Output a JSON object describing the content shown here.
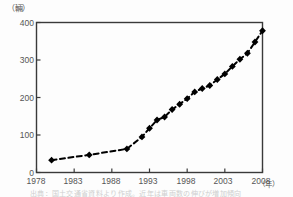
{
  "figure": {
    "unit_y": "（輛）",
    "unit_x": "（年）",
    "caption": "出典：国土交通省資料より作成。近年は車両数の伸びが増加傾向"
  },
  "chart_data": {
    "type": "line",
    "title": "",
    "xlabel": "（年）",
    "ylabel": "（輛）",
    "xlim": [
      1978,
      2008
    ],
    "ylim": [
      0,
      400
    ],
    "grid": false,
    "legend": "none",
    "line_style": "dashed",
    "marker": "diamond",
    "marker_color": "#000000",
    "line_color": "#000000",
    "xticks": [
      1978,
      1983,
      1988,
      1993,
      1998,
      2003,
      2008
    ],
    "yticks": [
      0,
      100,
      200,
      300,
      400
    ],
    "series": [
      {
        "name": "車両数",
        "points": [
          {
            "x": 1980,
            "y": 33
          },
          {
            "x": 1985,
            "y": 47
          },
          {
            "x": 1990,
            "y": 63
          },
          {
            "x": 1992,
            "y": 95
          },
          {
            "x": 1993,
            "y": 118
          },
          {
            "x": 1994,
            "y": 140
          },
          {
            "x": 1995,
            "y": 148
          },
          {
            "x": 1996,
            "y": 168
          },
          {
            "x": 1997,
            "y": 182
          },
          {
            "x": 1998,
            "y": 197
          },
          {
            "x": 1999,
            "y": 215
          },
          {
            "x": 2000,
            "y": 224
          },
          {
            "x": 2001,
            "y": 232
          },
          {
            "x": 2002,
            "y": 248
          },
          {
            "x": 2003,
            "y": 263
          },
          {
            "x": 2004,
            "y": 283
          },
          {
            "x": 2005,
            "y": 302
          },
          {
            "x": 2006,
            "y": 318
          },
          {
            "x": 2007,
            "y": 348
          },
          {
            "x": 2008,
            "y": 378
          }
        ]
      }
    ]
  },
  "ytick_labels": [
    "400",
    "300",
    "200",
    "100",
    "0"
  ],
  "xtick_labels": [
    "1978",
    "1983",
    "1988",
    "1993",
    "1998",
    "2003",
    "2008"
  ]
}
